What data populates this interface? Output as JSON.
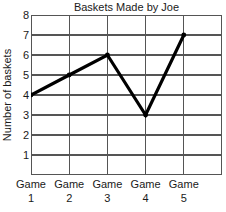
{
  "chart_data": {
    "type": "line",
    "title": "Baskets Made by Joe",
    "xlabel": "",
    "ylabel": "Number of baskets",
    "categories": [
      "Game 1",
      "Game 2",
      "Game 3",
      "Game 4",
      "Game 5"
    ],
    "category_lines": [
      {
        "line1": "Game",
        "line2": "1"
      },
      {
        "line1": "Game",
        "line2": "2"
      },
      {
        "line1": "Game",
        "line2": "3"
      },
      {
        "line1": "Game",
        "line2": "4"
      },
      {
        "line1": "Game",
        "line2": "5"
      }
    ],
    "values": [
      4,
      5,
      6,
      3,
      7
    ],
    "ylim": [
      0,
      8
    ],
    "yticks": [
      1,
      2,
      3,
      4,
      5,
      6,
      7,
      8
    ],
    "ytick_labels": [
      "1",
      "2",
      "3",
      "4",
      "5",
      "6",
      "7",
      "8"
    ],
    "grid": true,
    "legend": false,
    "series_color": "#000000",
    "grid_color": "#555555",
    "marker": "dot"
  }
}
